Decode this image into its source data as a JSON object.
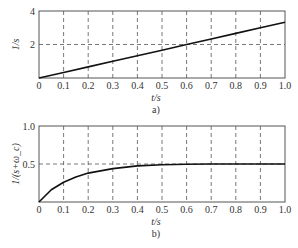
{
  "chart_data": [
    {
      "type": "line",
      "panel_label": "a)",
      "title": "",
      "xlabel": "t/s",
      "ylabel": "1/s",
      "xlim": [
        0,
        1.0
      ],
      "ylim": [
        0,
        4
      ],
      "x_ticks": [
        "0",
        "0.1",
        "0.2",
        "0.3",
        "0.4",
        "0.5",
        "0.6",
        "0.7",
        "0.8",
        "0.9",
        "1.0"
      ],
      "y_ticks": [
        "2",
        "4"
      ],
      "grid": "dashed",
      "series": [
        {
          "name": "1/s",
          "x": [
            0,
            0.1,
            0.2,
            0.3,
            0.4,
            0.5,
            0.6,
            0.7,
            0.8,
            0.9,
            1.0
          ],
          "values": [
            0,
            0.33,
            0.66,
            1.0,
            1.33,
            1.66,
            2.0,
            2.33,
            2.66,
            3.0,
            3.33
          ]
        }
      ]
    },
    {
      "type": "line",
      "panel_label": "b)",
      "title": "",
      "xlabel": "t/s",
      "ylabel": "1/(s+ω_c)",
      "xlim": [
        0,
        1.0
      ],
      "ylim": [
        0,
        1.0
      ],
      "x_ticks": [
        "0",
        "0.1",
        "0.2",
        "0.3",
        "0.4",
        "0.5",
        "0.6",
        "0.7",
        "0.8",
        "0.9",
        "1.0"
      ],
      "y_ticks": [
        "0.5",
        "1.0"
      ],
      "grid": "dashed",
      "series": [
        {
          "name": "1/(s+ωc)",
          "x": [
            0,
            0.05,
            0.1,
            0.15,
            0.2,
            0.3,
            0.4,
            0.5,
            0.6,
            0.7,
            0.8,
            0.9,
            1.0
          ],
          "values": [
            0,
            0.16,
            0.26,
            0.33,
            0.38,
            0.44,
            0.475,
            0.49,
            0.497,
            0.5,
            0.5,
            0.5,
            0.5
          ]
        }
      ]
    }
  ]
}
